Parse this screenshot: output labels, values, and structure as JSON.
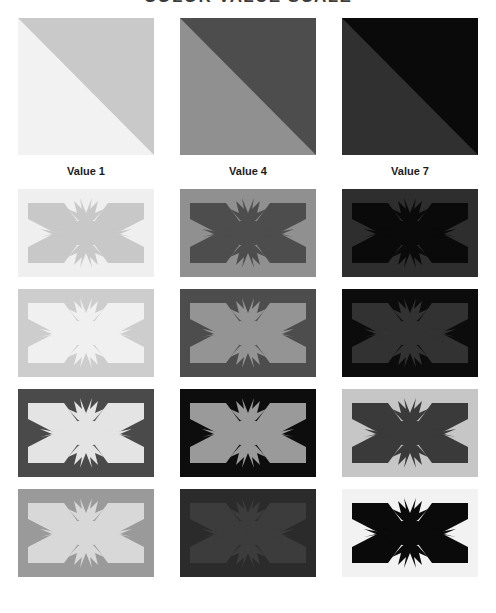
{
  "title": "COLOR VALUE SCALE",
  "columns": [
    {
      "label": "Value 1"
    },
    {
      "label": "Value 4"
    },
    {
      "label": "Value 7"
    }
  ],
  "chart_data": {
    "type": "table",
    "title": "COLOR VALUE SCALE",
    "xlabel": "",
    "ylabel": "",
    "categories": [
      "Value 1",
      "Value 4",
      "Value 7"
    ],
    "grid": false,
    "legend": "none",
    "rows": [
      {
        "name": "diagonal-split",
        "kind": "diagonal",
        "cells": [
          {
            "column": "Value 1",
            "upper": "#c9c9c9",
            "lower": "#f2f2f2"
          },
          {
            "column": "Value 4",
            "upper": "#4d4d4d",
            "lower": "#909090"
          },
          {
            "column": "Value 7",
            "upper": "#0a0a0a",
            "lower": "#303030"
          }
        ]
      },
      {
        "name": "flag-row-1",
        "kind": "flag",
        "cells": [
          {
            "column": "Value 1",
            "ground": "#efefef",
            "figure": "#c8c8c8"
          },
          {
            "column": "Value 4",
            "ground": "#909090",
            "figure": "#4d4d4d"
          },
          {
            "column": "Value 7",
            "ground": "#2e2e2e",
            "figure": "#0a0a0a"
          }
        ]
      },
      {
        "name": "flag-row-2",
        "kind": "flag",
        "cells": [
          {
            "column": "Value 1",
            "ground": "#cdcdcd",
            "figure": "#f0f0f0"
          },
          {
            "column": "Value 4",
            "ground": "#4d4d4d",
            "figure": "#949494"
          },
          {
            "column": "Value 7",
            "ground": "#0c0c0c",
            "figure": "#323232"
          }
        ]
      },
      {
        "name": "flag-row-3",
        "kind": "flag",
        "cells": [
          {
            "column": "Value 1",
            "ground": "#4a4a4a",
            "figure": "#e4e4e4"
          },
          {
            "column": "Value 4",
            "ground": "#0d0d0d",
            "figure": "#9a9a9a"
          },
          {
            "column": "Value 7",
            "ground": "#c6c6c6",
            "figure": "#3a3a3a"
          }
        ]
      },
      {
        "name": "flag-row-4",
        "kind": "flag",
        "cells": [
          {
            "column": "Value 1",
            "ground": "#9a9a9a",
            "figure": "#d8d8d8"
          },
          {
            "column": "Value 4",
            "ground": "#2b2b2b",
            "figure": "#3c3c3c"
          },
          {
            "column": "Value 7",
            "ground": "#f2f2f2",
            "figure": "#0a0a0a"
          }
        ]
      }
    ],
    "value_steps": [
      "Value 1",
      "Value 4",
      "Value 7"
    ],
    "emblem": "saltire-star-flag"
  }
}
